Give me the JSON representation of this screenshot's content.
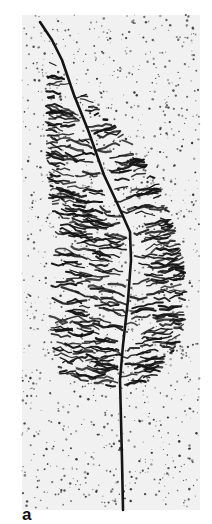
{
  "figure": {
    "panel_label": "a",
    "colors": {
      "background": "#ffffff",
      "stain": "#141414",
      "speckle": "#2a2a2a",
      "field_tint": "#f1f1f1"
    },
    "panel_bounds": {
      "x": 22,
      "y": 15,
      "width": 178,
      "height": 495
    },
    "trunk_path": [
      [
        40,
        22
      ],
      [
        52,
        40
      ],
      [
        62,
        60
      ],
      [
        74,
        95
      ],
      [
        88,
        130
      ],
      [
        104,
        175
      ],
      [
        118,
        205
      ],
      [
        130,
        232
      ],
      [
        131,
        260
      ],
      [
        128,
        300
      ],
      [
        123,
        345
      ],
      [
        120,
        380
      ],
      [
        121,
        420
      ],
      [
        122,
        460
      ],
      [
        123,
        510
      ]
    ],
    "canopy_outline": [
      [
        48,
        55
      ],
      [
        70,
        70
      ],
      [
        100,
        110
      ],
      [
        135,
        145
      ],
      [
        160,
        185
      ],
      [
        180,
        240
      ],
      [
        188,
        290
      ],
      [
        182,
        340
      ],
      [
        160,
        375
      ],
      [
        130,
        390
      ],
      [
        95,
        385
      ],
      [
        60,
        375
      ],
      [
        50,
        340
      ],
      [
        48,
        290
      ],
      [
        52,
        240
      ],
      [
        48,
        190
      ],
      [
        45,
        130
      ],
      [
        46,
        90
      ]
    ],
    "branch_density": 420,
    "speckle_count": 1300,
    "seed": 7
  }
}
